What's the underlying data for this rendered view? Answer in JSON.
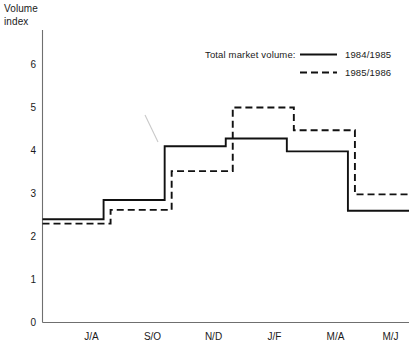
{
  "chart_data": {
    "type": "line",
    "title": "",
    "subtitle": "",
    "ylabel": "Volume\nindex",
    "xlabel": "",
    "categories": [
      "J/A",
      "S/O",
      "N/D",
      "J/F",
      "M/A",
      "M/J"
    ],
    "ylim": [
      0,
      6.6
    ],
    "yticks": [
      0,
      1,
      2,
      3,
      4,
      5,
      6
    ],
    "ytick_labels": [
      "0",
      "1",
      "2",
      "3",
      "4",
      "5",
      "6"
    ],
    "grid": false,
    "step_style": "step-post",
    "legend_position": "top-right",
    "legend_title": "Total market volume:",
    "series": [
      {
        "name": "1984/1985",
        "style": "solid",
        "values": [
          2.4,
          2.85,
          4.1,
          4.28,
          3.98,
          2.6
        ]
      },
      {
        "name": "1985/1986",
        "style": "dashed",
        "values": [
          2.3,
          2.62,
          3.52,
          5.0,
          4.47,
          2.98
        ]
      }
    ],
    "annotations": []
  },
  "axis": {
    "y_title_line1": "Volume",
    "y_title_line2": "index"
  },
  "legend": {
    "title": "Total market volume:",
    "entries": [
      {
        "label": "1984/1985",
        "style": "solid"
      },
      {
        "label": "1985/1986",
        "style": "dashed"
      }
    ]
  }
}
